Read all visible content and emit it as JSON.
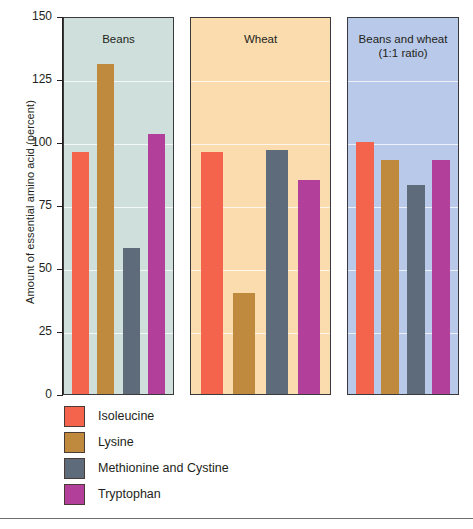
{
  "chart_data": {
    "type": "bar",
    "title": "",
    "xlabel": "",
    "ylabel": "Amount of essential amino acid (percent)",
    "ylim": [
      0,
      150
    ],
    "yticks": [
      0,
      25,
      50,
      75,
      100,
      125,
      150
    ],
    "ytick_labels": [
      "0",
      "25",
      "50",
      "75",
      "100",
      "125",
      "150"
    ],
    "grid": true,
    "legend_position": "below-left",
    "categories": [
      "Beans",
      "Wheat",
      "Beans and wheat\n(1:1 ratio)"
    ],
    "panels": [
      {
        "label": "Beans",
        "label_line1": "Beans",
        "label_line2": "",
        "background": "#cfe0dc",
        "values": [
          96,
          131,
          58,
          103
        ]
      },
      {
        "label": "Wheat",
        "label_line1": "Wheat",
        "label_line2": "",
        "background": "#fadcae",
        "values": [
          96,
          40,
          97,
          85
        ]
      },
      {
        "label": "Beans and wheat (1:1 ratio)",
        "label_line1": "Beans and wheat",
        "label_line2": "(1:1 ratio)",
        "background": "#b9c9e9",
        "values": [
          100,
          93,
          83,
          93
        ]
      }
    ],
    "series": [
      {
        "name": "Isoleucine",
        "color": "#f4634b",
        "values": [
          96,
          96,
          100
        ]
      },
      {
        "name": "Lysine",
        "color": "#c08a3e",
        "values": [
          131,
          40,
          93
        ]
      },
      {
        "name": "Methionine and Cystine",
        "color": "#5e6b7a",
        "values": [
          58,
          97,
          83
        ]
      },
      {
        "name": "Tryptophan",
        "color": "#b23f99",
        "values": [
          103,
          85,
          93
        ]
      }
    ]
  },
  "legend": {
    "items": [
      {
        "label": "Isoleucine",
        "color": "#f4634b"
      },
      {
        "label": "Lysine",
        "color": "#c08a3e"
      },
      {
        "label": "Methionine and Cystine",
        "color": "#5e6b7a"
      },
      {
        "label": "Tryptophan",
        "color": "#b23f99"
      }
    ]
  }
}
